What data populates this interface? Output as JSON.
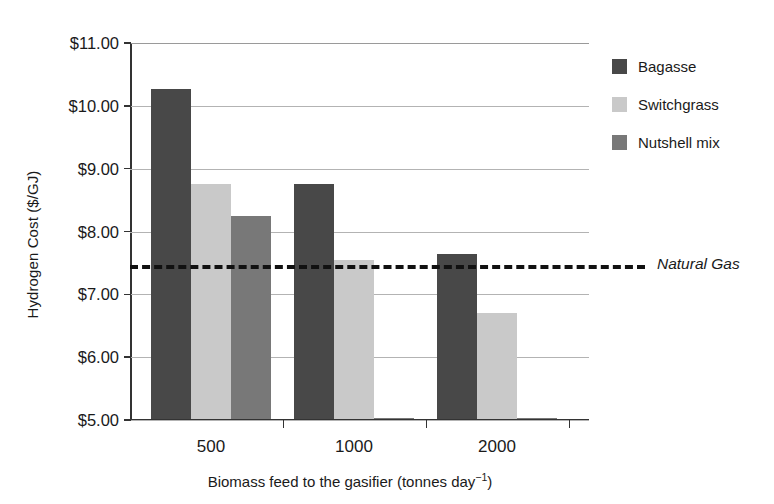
{
  "chart_data": {
    "type": "bar",
    "title": "",
    "subtitle": "",
    "xlabel_text": "Biomass feed to the gasifier (tonnes day",
    "xlabel_exponent": "−1",
    "xlabel_close": ")",
    "xlabel": "Biomass feed to the gasifier (tonnes day−1)",
    "ylabel": "Hydrogen Cost ($/GJ)",
    "categories": [
      "500",
      "1000",
      "2000"
    ],
    "ylim": [
      5.0,
      11.0
    ],
    "ytick_labels": [
      "$11.00",
      "$10.00",
      "$9.00",
      "$8.00",
      "$7.00",
      "$6.00",
      "$5.00"
    ],
    "ytick_values": [
      11.0,
      10.0,
      9.0,
      8.0,
      7.0,
      6.0,
      5.0
    ],
    "grid": true,
    "legend_position": "right",
    "series": [
      {
        "name": "Bagasse",
        "color": "#484848",
        "values": [
          10.27,
          8.75,
          7.65
        ]
      },
      {
        "name": "Switchgrass",
        "color": "#c9c9c9",
        "values": [
          8.75,
          7.55,
          6.7
        ]
      },
      {
        "name": "Nutshell mix",
        "color": "#787878",
        "values": [
          8.25,
          5.03,
          5.03
        ]
      }
    ],
    "annotations": [
      {
        "name": "natural-gas-reference-line",
        "label": "Natural Gas",
        "value": 7.47,
        "style": "dashed",
        "color": "#111111"
      }
    ]
  }
}
